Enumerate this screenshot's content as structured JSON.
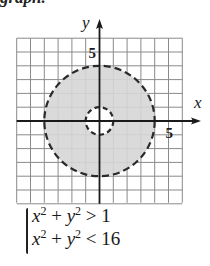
{
  "header_fragment": "graph.",
  "chart_data": {
    "type": "area",
    "title": "",
    "xlabel": "x",
    "ylabel": "y",
    "xlim": [
      -6,
      6
    ],
    "ylim": [
      -6,
      6
    ],
    "grid": true,
    "x_tick_labels": [
      {
        "value": 5,
        "label": "5"
      }
    ],
    "y_tick_labels": [
      {
        "value": 5,
        "label": "5"
      }
    ],
    "regions": [
      {
        "name": "annulus",
        "shape": "ring",
        "center": [
          0,
          0
        ],
        "inner_radius": 1,
        "outer_radius": 4,
        "inner_boundary": "dashed",
        "outer_boundary": "dashed",
        "shaded": true
      }
    ],
    "colors": {
      "fill": "#d6d6d6",
      "boundary": "#2a2a2a",
      "grid": "#8a8a8a",
      "axis": "#1a1a1a"
    }
  },
  "system": {
    "lines": [
      {
        "lhs_a": "x",
        "lhs_b": "y",
        "exp": "2",
        "plus": "+",
        "op": ">",
        "rhs": "1"
      },
      {
        "lhs_a": "x",
        "lhs_b": "y",
        "exp": "2",
        "plus": "+",
        "op": "<",
        "rhs": "16"
      }
    ]
  }
}
